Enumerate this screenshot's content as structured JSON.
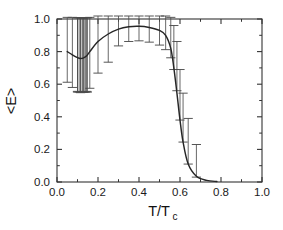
{
  "chart_data": {
    "type": "line",
    "title": "",
    "subtitle": "",
    "xlabel": "T/Tc",
    "xlabel_main": "T/T",
    "xlabel_sub": "c",
    "ylabel": "<E>",
    "xlim": [
      0.0,
      1.0
    ],
    "ylim": [
      0.0,
      1.0
    ],
    "grid": false,
    "legend": null,
    "xticks": [
      0.0,
      0.2,
      0.4,
      0.6,
      0.8,
      1.0
    ],
    "xtick_labels": [
      "0.0",
      "0.2",
      "0.4",
      "0.6",
      "0.8",
      "1.0"
    ],
    "yticks": [
      0.0,
      0.2,
      0.4,
      0.6,
      0.8,
      1.0
    ],
    "ytick_labels": [
      "0.0",
      "0.2",
      "0.4",
      "0.6",
      "0.8",
      "1.0"
    ],
    "minor_xticks": [
      0.1,
      0.3,
      0.5,
      0.7,
      0.9
    ],
    "minor_yticks": [
      0.1,
      0.3,
      0.5,
      0.7,
      0.9
    ],
    "line_color": "#262626",
    "errorbar_color": "#4d4d4d",
    "axis_color": "#333333",
    "x": [
      0.05,
      0.075,
      0.1,
      0.115,
      0.13,
      0.145,
      0.16,
      0.2,
      0.25,
      0.3,
      0.35,
      0.4,
      0.45,
      0.5,
      0.53,
      0.555,
      0.57,
      0.585,
      0.6,
      0.615,
      0.64,
      0.68,
      0.73,
      0.78
    ],
    "y": [
      0.8,
      0.78,
      0.763,
      0.758,
      0.762,
      0.775,
      0.8,
      0.862,
      0.908,
      0.938,
      0.952,
      0.955,
      0.948,
      0.93,
      0.9,
      0.82,
      0.7,
      0.545,
      0.38,
      0.245,
      0.11,
      0.035,
      0.01,
      0.003
    ],
    "yerr_upper": [
      1.01,
      1.01,
      1.008,
      1.008,
      1.008,
      1.008,
      1.01,
      1.02,
      1.038,
      1.042,
      1.042,
      1.042,
      1.04,
      1.038,
      1.03,
      1.01,
      0.96,
      0.862,
      0.69,
      0.545,
      0.39,
      0.23,
      0.12,
      0.06
    ],
    "yerr_lower": [
      0.612,
      0.58,
      0.556,
      0.548,
      0.55,
      0.556,
      0.575,
      0.668,
      0.735,
      0.835,
      0.862,
      0.866,
      0.858,
      0.84,
      0.812,
      0.762,
      0.69,
      0.56,
      0.38,
      0.245,
      0.11,
      0.03,
      -0.02,
      -0.04
    ],
    "errorbar_indices": [
      0,
      1,
      2,
      3,
      4,
      5,
      6,
      7,
      8,
      9,
      10,
      11,
      12,
      13,
      14,
      15,
      16,
      17,
      18,
      19,
      20,
      21
    ],
    "dense_cluster_x": [
      0.1,
      0.108,
      0.116,
      0.124,
      0.132,
      0.14,
      0.148
    ],
    "dense_cluster_top": 1.008,
    "dense_cluster_bottom": 0.552
  },
  "plot_area": {
    "left": 57,
    "right": 262,
    "top": 19,
    "bottom": 182
  }
}
